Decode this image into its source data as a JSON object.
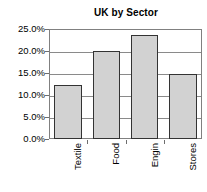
{
  "chart_data": {
    "type": "bar",
    "title": "UK by Sector",
    "xlabel": "",
    "ylabel": "",
    "categories": [
      "Textile",
      "Food",
      "Engin",
      "Stores"
    ],
    "values": [
      12.2,
      20.0,
      23.7,
      14.7
    ],
    "value_labels": [
      "12.2%",
      "20.0%",
      "23.7%",
      "14.7%"
    ],
    "ylim": [
      0,
      25
    ],
    "y_ticks": [
      0,
      5,
      10,
      15,
      20,
      25
    ],
    "y_tick_labels": [
      "0.0%",
      "5.0%",
      "10.0%",
      "15.0%",
      "20.0%",
      "25.0%"
    ],
    "grid": true,
    "legend": false,
    "legend_position": "none",
    "bar_fill_color": "#d2d2d2",
    "bar_border_color": "#333333",
    "gridline_color": "#8a8a8a",
    "axis_color": "#808080",
    "background_color": "#ffffff",
    "text_color": "#000000"
  }
}
